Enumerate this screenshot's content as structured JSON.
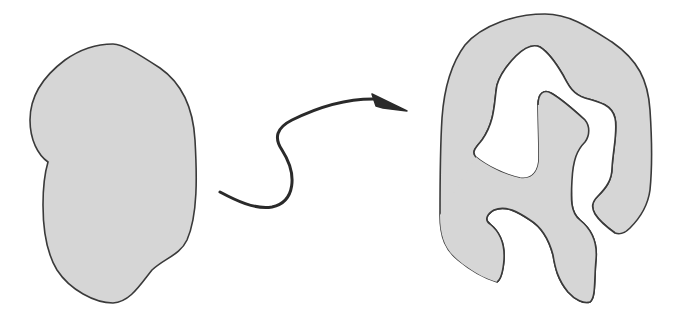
{
  "diagram": {
    "colors": {
      "background": "#ffffff",
      "shape_fill": "#d6d6d6",
      "stroke": "#3a3a3a",
      "arrow": "#2a2a2a"
    },
    "nodes": [
      {
        "id": "simple-blob",
        "label": ""
      },
      {
        "id": "complex-shape",
        "label": ""
      }
    ],
    "edges": [
      {
        "from": "simple-blob",
        "to": "complex-shape",
        "style": "curved-arrow",
        "label": ""
      }
    ]
  }
}
